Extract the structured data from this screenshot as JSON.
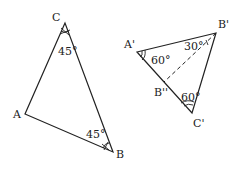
{
  "diagram": {
    "type": "geometry",
    "triangle_left": {
      "vertices": {
        "A": {
          "label": "A",
          "x": 25,
          "y": 114
        },
        "B": {
          "label": "B",
          "x": 113,
          "y": 152
        },
        "C": {
          "label": "C",
          "x": 65,
          "y": 23
        }
      },
      "angles": {
        "C": "45°",
        "B": "45°"
      }
    },
    "triangle_right": {
      "vertices": {
        "A_prime": {
          "label": "A'",
          "x": 137,
          "y": 52
        },
        "B_prime": {
          "label": "B'",
          "x": 216,
          "y": 33
        },
        "C_prime": {
          "label": "C'",
          "x": 192,
          "y": 113
        },
        "B_double_prime": {
          "label": "B''",
          "x": 164,
          "y": 82
        }
      },
      "angles": {
        "A_prime": "60°",
        "B_prime_partial": "30°",
        "C_prime": "60°"
      },
      "dashed_segment": [
        "B'",
        "B''"
      ]
    }
  }
}
